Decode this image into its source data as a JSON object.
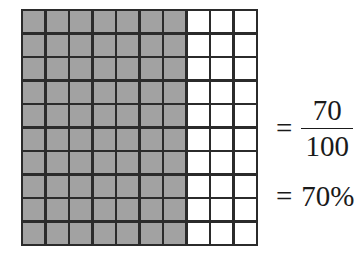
{
  "figure": {
    "background_color": "#ffffff"
  },
  "grid": {
    "rows": 10,
    "columns": 10,
    "total_cells": 100,
    "shaded_cells": 70,
    "unshaded_cells": 30,
    "shaded_columns": 7,
    "unshaded_columns": 3,
    "shaded_color": "#a2a2a2",
    "unshaded_color": "#ffffff",
    "line_color": "#2b2b2b"
  },
  "math": {
    "equals_sign_1": "=",
    "equals_sign_2": "=",
    "fraction": {
      "numerator": "70",
      "denominator": "100"
    },
    "percent": "70%"
  },
  "chart_data": {
    "type": "heatmap",
    "title": "",
    "xlabel": "",
    "ylabel": "",
    "rows": 10,
    "columns": 10,
    "legend": [],
    "annotations": [
      "= 70/100",
      "= 70%"
    ],
    "values": [
      [
        1,
        1,
        1,
        1,
        1,
        1,
        1,
        0,
        0,
        0
      ],
      [
        1,
        1,
        1,
        1,
        1,
        1,
        1,
        0,
        0,
        0
      ],
      [
        1,
        1,
        1,
        1,
        1,
        1,
        1,
        0,
        0,
        0
      ],
      [
        1,
        1,
        1,
        1,
        1,
        1,
        1,
        0,
        0,
        0
      ],
      [
        1,
        1,
        1,
        1,
        1,
        1,
        1,
        0,
        0,
        0
      ],
      [
        1,
        1,
        1,
        1,
        1,
        1,
        1,
        0,
        0,
        0
      ],
      [
        1,
        1,
        1,
        1,
        1,
        1,
        1,
        0,
        0,
        0
      ],
      [
        1,
        1,
        1,
        1,
        1,
        1,
        1,
        0,
        0,
        0
      ],
      [
        1,
        1,
        1,
        1,
        1,
        1,
        1,
        0,
        0,
        0
      ],
      [
        1,
        1,
        1,
        1,
        1,
        1,
        1,
        0,
        0,
        0
      ]
    ]
  }
}
